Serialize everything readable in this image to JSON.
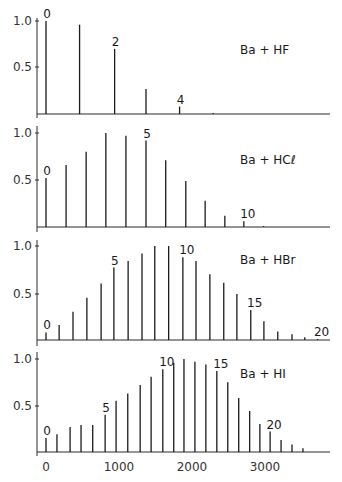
{
  "chart_data": [
    {
      "type": "bar",
      "title": "Ba + HF",
      "xlabel": "",
      "ylabel": "",
      "ylim": [
        0,
        1.0
      ],
      "yticks": [
        "1.0",
        "0.5"
      ],
      "x": [
        0,
        460,
        940,
        1370,
        1830,
        2290
      ],
      "vibrational_levels": [
        0,
        1,
        2,
        3,
        4,
        5
      ],
      "values": [
        1.0,
        0.96,
        0.7,
        0.27,
        0.08,
        0.01
      ],
      "labels": {
        "0": "0",
        "2": "2",
        "4": "4"
      }
    },
    {
      "type": "bar",
      "title": "Ba + HCℓ",
      "xlabel": "",
      "ylabel": "",
      "ylim": [
        0,
        1.0
      ],
      "yticks": [
        "1.0",
        "0.5"
      ],
      "x": [
        0,
        275,
        550,
        820,
        1095,
        1370,
        1640,
        1915,
        2180,
        2450,
        2710,
        2980
      ],
      "vibrational_levels": [
        0,
        1,
        2,
        3,
        4,
        5,
        6,
        7,
        8,
        9,
        10,
        11
      ],
      "values": [
        0.52,
        0.66,
        0.8,
        1.0,
        0.97,
        0.92,
        0.71,
        0.49,
        0.28,
        0.12,
        0.06,
        0.01
      ],
      "labels": {
        "0": "0",
        "5": "5",
        "10": "10"
      }
    },
    {
      "type": "bar",
      "title": "Ba + HBr",
      "xlabel": "",
      "ylabel": "",
      "ylim": [
        0,
        1.0
      ],
      "yticks": [
        "1.0",
        "0.5"
      ],
      "x": [
        0,
        180,
        370,
        560,
        755,
        930,
        1125,
        1315,
        1490,
        1680,
        1875,
        2055,
        2245,
        2435,
        2615,
        2805,
        2985,
        3175,
        3370,
        3545,
        3720
      ],
      "vibrational_levels": [
        0,
        1,
        2,
        3,
        4,
        5,
        6,
        7,
        8,
        9,
        10,
        11,
        12,
        13,
        14,
        15,
        16,
        17,
        18,
        19,
        20
      ],
      "values": [
        0.08,
        0.16,
        0.3,
        0.45,
        0.6,
        0.77,
        0.84,
        0.92,
        1.0,
        1.0,
        0.88,
        0.84,
        0.7,
        0.61,
        0.49,
        0.32,
        0.2,
        0.09,
        0.06,
        0.03,
        0.01
      ],
      "labels": {
        "0": "0",
        "5": "5",
        "10": "10",
        "15": "15",
        "20": "20"
      }
    },
    {
      "type": "bar",
      "title": "Ba + HI",
      "xlabel": "",
      "ylabel": "",
      "ylim": [
        0,
        1.0
      ],
      "yticks": [
        "1.0",
        "0.5"
      ],
      "xticks": [
        "0",
        "1000",
        "2000",
        "3000"
      ],
      "xlim": [
        0,
        3900
      ],
      "x": [
        0,
        150,
        330,
        480,
        640,
        810,
        960,
        1120,
        1290,
        1440,
        1600,
        1750,
        1890,
        2040,
        2190,
        2340,
        2490,
        2640,
        2790,
        2930,
        3070,
        3220,
        3370,
        3520
      ],
      "vibrational_levels": [
        0,
        1,
        2,
        3,
        4,
        5,
        6,
        7,
        8,
        9,
        10,
        11,
        12,
        13,
        14,
        15,
        16,
        17,
        18,
        19,
        20,
        21,
        22,
        23
      ],
      "values": [
        0.15,
        0.19,
        0.27,
        0.29,
        0.29,
        0.4,
        0.55,
        0.63,
        0.72,
        0.81,
        0.89,
        0.96,
        1.0,
        0.97,
        0.94,
        0.87,
        0.75,
        0.58,
        0.44,
        0.3,
        0.22,
        0.13,
        0.08,
        0.04
      ],
      "labels": {
        "0": "0",
        "5": "5",
        "10": "10",
        "15": "15",
        "20": "20"
      }
    }
  ],
  "panels": [
    {
      "title": "Ba + HF",
      "ytick_top": "1.0",
      "ytick_mid": "0.5"
    },
    {
      "title": "Ba + HCℓ",
      "ytick_top": "1.0",
      "ytick_mid": "0.5"
    },
    {
      "title": "Ba + HBr",
      "ytick_top": "1.0",
      "ytick_mid": "0.5"
    },
    {
      "title": "Ba + HI",
      "ytick_top": "1.0",
      "ytick_mid": "0.5"
    }
  ],
  "x_axis": {
    "ticks": [
      "0",
      "1000",
      "2000",
      "3000"
    ]
  }
}
